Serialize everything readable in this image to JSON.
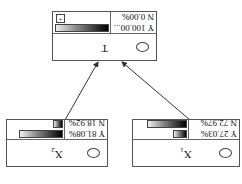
{
  "nodes": {
    "x1": {
      "name": "X",
      "sub": "1",
      "y_label": "Y 27.03%",
      "n_label": "N 72.97%",
      "y_pct": 27.03,
      "n_pct": 72.97
    },
    "x2": {
      "name": "X",
      "sub": "2",
      "y_label": "Y 81.08%",
      "n_label": "N 18.92%",
      "y_pct": 81.08,
      "n_pct": 18.92
    },
    "t": {
      "name": "T",
      "y_label": "Y 100.00...",
      "n_label": "N 0.00%",
      "y_pct": 100,
      "n_pct": 0,
      "expand_icon": "+"
    }
  },
  "edges": [
    {
      "from": "x1",
      "to": "t"
    },
    {
      "from": "x2",
      "to": "t"
    }
  ],
  "colors": {
    "border": "#555555",
    "edge": "#333333",
    "bar_dark": "#000000",
    "bar_light": "#eeeeee"
  }
}
